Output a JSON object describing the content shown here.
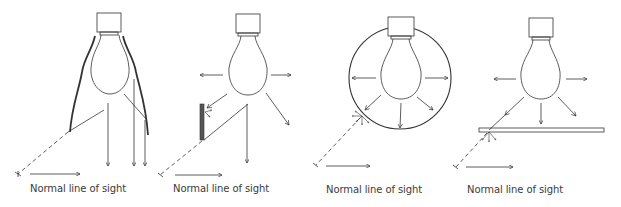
{
  "figure": {
    "panels": [
      {
        "id": "reflector-shield",
        "caption": "Normal line of sight"
      },
      {
        "id": "side-shield",
        "caption": "Normal line of sight"
      },
      {
        "id": "diffuser-globe",
        "caption": "Normal line of sight"
      },
      {
        "id": "horizontal-diffuser",
        "caption": "Normal line of sight"
      }
    ]
  },
  "colors": {
    "stroke": "#333333",
    "background": "#ffffff",
    "shield": "#555555"
  }
}
